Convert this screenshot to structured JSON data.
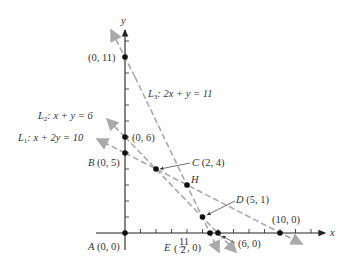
{
  "axes": {
    "x_label": "x",
    "y_label": "y"
  },
  "lines": {
    "L1": {
      "name": "L",
      "sub": "1",
      "eq": ": x + 2y = 10"
    },
    "L2": {
      "name": "L",
      "sub": "2",
      "eq": ": x + y = 6"
    },
    "L3": {
      "name": "L",
      "sub": "3",
      "eq": ": 2x + y = 11"
    }
  },
  "points": {
    "A": {
      "name": "A",
      "coord": "(0, 0)"
    },
    "B": {
      "name": "B",
      "coord": "(0, 5)"
    },
    "C": {
      "name": "C",
      "coord": "(2, 4)"
    },
    "D": {
      "name": "D",
      "coord": "(5, 1)"
    },
    "E": {
      "name": "E",
      "coord_pre": "(",
      "num": "11",
      "den": "2",
      "coord_post": ", 0)"
    },
    "H": {
      "name": "H"
    },
    "p011": {
      "coord": "(0, 11)"
    },
    "p06": {
      "coord": "(0, 6)"
    },
    "p60": {
      "coord": "(6, 0)"
    },
    "p100": {
      "coord": "(10, 0)"
    }
  },
  "colors": {
    "axis": "#222222",
    "line": "#aaaaaa",
    "point": "#111111",
    "text": "#333333"
  }
}
